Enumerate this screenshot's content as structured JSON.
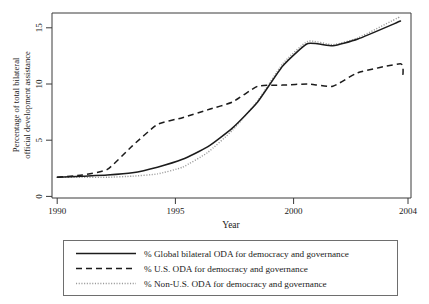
{
  "chart_data": {
    "type": "line",
    "title": "",
    "xlabel": "Year",
    "ylabel": "Percentage of total bilateral official development assistance",
    "ylabel_line1": "Percentage of total bilateral",
    "ylabel_line2": "official development assistance",
    "xlim": [
      1990,
      2004
    ],
    "ylim": [
      0,
      16.5
    ],
    "xticks": [
      1990,
      1995,
      2000,
      2004
    ],
    "xtick_labels": [
      "1990",
      "1995",
      "2000",
      "2004"
    ],
    "yticks": [
      0,
      5,
      10,
      15
    ],
    "ytick_labels": [
      "0",
      "5",
      "10",
      "15"
    ],
    "grid": false,
    "legend_position": "below",
    "x": [
      1990,
      1991,
      1992,
      1993,
      1994,
      1995,
      1996,
      1997,
      1998,
      1999,
      2000,
      2001,
      2002,
      2003.7
    ],
    "series": [
      {
        "name": "% Global bilateral ODA for democracy and governance",
        "key": "global",
        "style": "solid",
        "color": "#1c1c1c",
        "values": [
          1.7,
          1.8,
          1.9,
          2.1,
          2.6,
          3.3,
          4.4,
          6.1,
          8.4,
          11.6,
          13.6,
          13.4,
          14.0,
          15.6
        ]
      },
      {
        "name": "% U.S. ODA for democracy and governance",
        "key": "us",
        "style": "dashed",
        "color": "#1c1c1c",
        "values": [
          1.7,
          1.9,
          2.4,
          4.5,
          6.4,
          7.0,
          7.7,
          8.4,
          9.8,
          9.9,
          10.0,
          9.8,
          11.0,
          11.8
        ]
      },
      {
        "name": "% Non-U.S. ODA for democracy and governance",
        "key": "nonus",
        "style": "dotted",
        "color": "#9a9a9a",
        "values": [
          1.7,
          1.7,
          1.7,
          1.8,
          2.0,
          2.6,
          3.9,
          5.9,
          8.5,
          11.8,
          13.8,
          13.5,
          14.1,
          16.0
        ]
      }
    ],
    "annotations": {
      "us_endpoint_value": 10.8,
      "us_peak_year": 2002.6,
      "us_peak_value": 11.8
    }
  },
  "legend": {
    "items": [
      {
        "label": "% Global bilateral ODA for democracy and governance",
        "style": "solid"
      },
      {
        "label": "% U.S. ODA for democracy and governance",
        "style": "dashed"
      },
      {
        "label": "% Non-U.S. ODA for democracy and governance",
        "style": "dotted"
      }
    ]
  },
  "axes": {
    "x_title": "Year",
    "y_title_line1": "Percentage of total bilateral",
    "y_title_line2": "official development assistance"
  }
}
